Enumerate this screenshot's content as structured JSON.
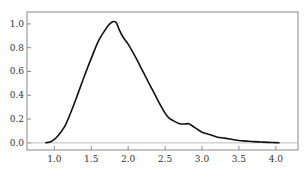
{
  "chart_data": {
    "type": "line",
    "title": "",
    "xlabel": "",
    "ylabel": "",
    "xlim": [
      0.63,
      4.3
    ],
    "ylim": [
      -0.06,
      1.1
    ],
    "grid": false,
    "legend": "none",
    "xticks": [
      1.0,
      1.5,
      2.0,
      2.5,
      3.0,
      3.5,
      4.0
    ],
    "xtick_labels": [
      "1.0",
      "1.5",
      "2.0",
      "2.5",
      "3.0",
      "3.5",
      "4.0"
    ],
    "yticks": [
      0.0,
      0.2,
      0.4,
      0.6,
      0.8,
      1.0
    ],
    "ytick_labels": [
      "0.0",
      "0.2",
      "0.4",
      "0.6",
      "0.8",
      "1.0"
    ],
    "baseline_y": 0.0,
    "series": [
      {
        "name": "density",
        "color": "#111111",
        "x": [
          0.88,
          0.95,
          1.0,
          1.05,
          1.1,
          1.15,
          1.2,
          1.3,
          1.4,
          1.5,
          1.6,
          1.7,
          1.75,
          1.8,
          1.84,
          1.88,
          1.93,
          2.0,
          2.1,
          2.2,
          2.3,
          2.4,
          2.5,
          2.55,
          2.6,
          2.7,
          2.78,
          2.82,
          2.9,
          3.0,
          3.1,
          3.2,
          3.3,
          3.4,
          3.5,
          3.6,
          3.7,
          3.8,
          3.9,
          4.0,
          4.05
        ],
        "y": [
          0.0,
          0.01,
          0.03,
          0.06,
          0.1,
          0.15,
          0.22,
          0.38,
          0.55,
          0.71,
          0.86,
          0.96,
          1.0,
          1.02,
          1.01,
          0.95,
          0.89,
          0.83,
          0.72,
          0.6,
          0.48,
          0.36,
          0.25,
          0.21,
          0.19,
          0.16,
          0.16,
          0.16,
          0.13,
          0.09,
          0.07,
          0.05,
          0.04,
          0.03,
          0.02,
          0.015,
          0.01,
          0.007,
          0.004,
          0.002,
          0.0
        ]
      }
    ]
  }
}
